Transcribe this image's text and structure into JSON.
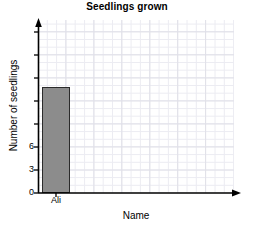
{
  "chart_data": {
    "type": "bar",
    "title": "Seedlings grown",
    "xlabel": "Name",
    "ylabel": "Number of seedlings",
    "categories": [
      "Ali"
    ],
    "values": [
      13.5
    ],
    "ytick_labels": [
      "0",
      "3",
      "6"
    ],
    "ytick_values": [
      0,
      3,
      6
    ],
    "ylim": [
      0,
      22
    ],
    "xlim": [
      0,
      7
    ],
    "grid": "light-grey minor grid, both directions",
    "legend": "none",
    "bar_color": "#8c8c8c",
    "bar_edge_color": "#2b2b2b",
    "grid_color": "#e8e8ee",
    "axis_color": "#000000"
  },
  "chart": {
    "title": "Seedlings grown",
    "xlabel": "Name",
    "ylabel": "Number of seedlings",
    "ytick_0": "0",
    "ytick_3": "3",
    "ytick_6": "6",
    "xtick_ali": "Ali"
  }
}
